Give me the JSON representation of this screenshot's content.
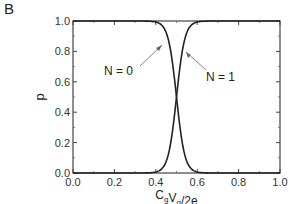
{
  "panel_label": "B",
  "chart_data": {
    "type": "line",
    "title": "",
    "xlabel": "C_g V_g / 2e",
    "xlabel_parts": {
      "c": "C",
      "csub": "g",
      "v": "V",
      "vsub": "g",
      "rest": "/2e"
    },
    "ylabel": "p",
    "xlim": [
      0.0,
      1.0
    ],
    "ylim": [
      0.0,
      1.0
    ],
    "xticks": [
      "0.0",
      "0.2",
      "0.4",
      "0.6",
      "0.8",
      "1.0"
    ],
    "yticks": [
      "0.0",
      "0.2",
      "0.4",
      "0.6",
      "0.8",
      "1.0"
    ],
    "grid": false,
    "legend": "none (inline annotations with arrows)",
    "series": [
      {
        "name": "N = 0",
        "x": [
          0.0,
          0.1,
          0.2,
          0.3,
          0.35,
          0.4,
          0.45,
          0.48,
          0.5,
          0.52,
          0.55,
          0.6,
          0.65,
          0.7,
          0.8,
          0.9,
          1.0
        ],
        "values": [
          1.0,
          1.0,
          0.99,
          0.98,
          0.96,
          0.91,
          0.77,
          0.6,
          0.5,
          0.4,
          0.23,
          0.09,
          0.04,
          0.02,
          0.01,
          0.0,
          0.0
        ]
      },
      {
        "name": "N = 1",
        "x": [
          0.0,
          0.1,
          0.2,
          0.3,
          0.35,
          0.4,
          0.45,
          0.48,
          0.5,
          0.52,
          0.55,
          0.6,
          0.65,
          0.7,
          0.8,
          0.9,
          1.0
        ],
        "values": [
          0.0,
          0.0,
          0.01,
          0.02,
          0.04,
          0.09,
          0.23,
          0.4,
          0.5,
          0.6,
          0.77,
          0.91,
          0.96,
          0.98,
          0.99,
          1.0,
          1.0
        ]
      }
    ],
    "annotations": [
      {
        "text": "N = 0",
        "points_to": "N = 0 curve near x≈0.44"
      },
      {
        "text": "N = 1",
        "points_to": "N = 1 curve near x≈0.55"
      }
    ]
  },
  "annotations": {
    "n0": "N = 0",
    "n1": "N = 1"
  }
}
